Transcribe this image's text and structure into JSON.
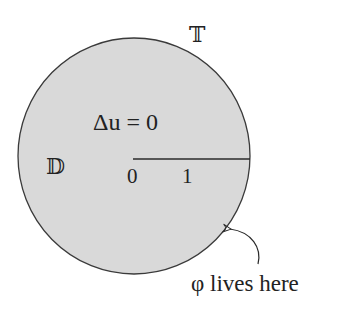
{
  "diagram": {
    "disc": {
      "fill": "#d9d9d9",
      "stroke": "#3a3a3a",
      "center": [
        134,
        156
      ],
      "radius_x": 116,
      "radius_y": 118
    },
    "labels": {
      "boundary": "𝕋",
      "domain": "𝔻",
      "equation": "Δu = 0",
      "origin": "0",
      "one": "1",
      "annotation": "φ lives here"
    },
    "segment": {
      "from": [
        133,
        159
      ],
      "to": [
        250,
        159
      ],
      "color": "#2a2a2a"
    },
    "arrow": {
      "tip": [
        228,
        229
      ],
      "color": "#2a2a2a"
    }
  }
}
